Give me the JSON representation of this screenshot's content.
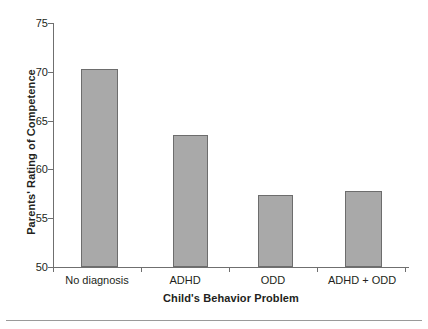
{
  "chart_data": {
    "type": "bar",
    "title": "",
    "xlabel": "Child's Behavior Problem",
    "ylabel": "Parents' Rating of Competence",
    "categories": [
      "No diagnosis",
      "ADHD",
      "ODD",
      "ADHD + ODD"
    ],
    "values": [
      70.3,
      63.5,
      57.4,
      57.8
    ],
    "ylim": [
      50,
      75
    ],
    "yticks": [
      50,
      55,
      60,
      65,
      70,
      75
    ],
    "ytick_labels": [
      "50",
      "55",
      "60",
      "65",
      "70",
      "75"
    ],
    "grid": false,
    "legend": null,
    "legend_position": "none",
    "bar_color": "#a9a9a9",
    "bar_edge_color": "#6d6d6d",
    "axis_color": "#6f6f6f",
    "text_color": "#231f20",
    "background": "#ffffff"
  }
}
